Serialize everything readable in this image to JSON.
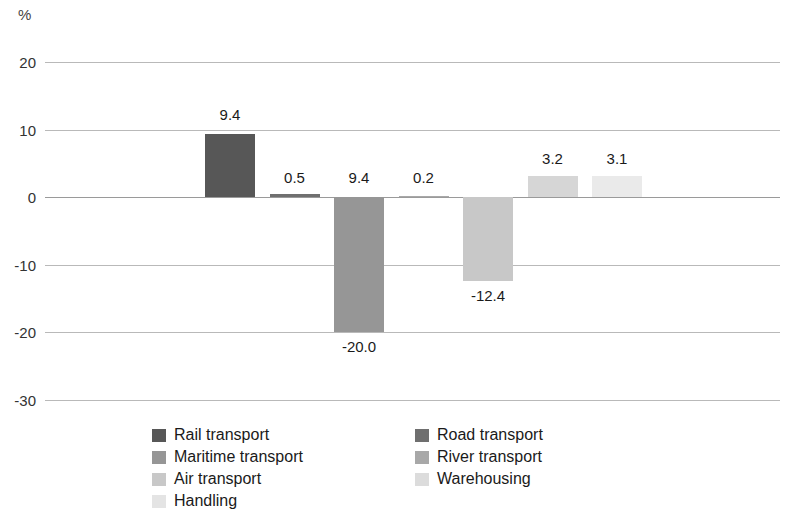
{
  "chart_data": {
    "type": "bar",
    "title": "",
    "subtitle": "",
    "unit_label": "%",
    "xlabel": "",
    "ylabel": "",
    "ylim": [
      -30,
      20
    ],
    "yticks": [
      "20",
      "10",
      "0",
      "-10",
      "-20",
      "-30"
    ],
    "ytick_values": [
      20,
      10,
      0,
      -10,
      -20,
      -30
    ],
    "grid": true,
    "legend_position": "bottom",
    "categories": [
      "Rail transport",
      "Road transport",
      "Maritime transport",
      "River transport",
      "Air transport",
      "Handling",
      "Warehousing"
    ],
    "values": [
      9.4,
      0.5,
      -20.0,
      0.2,
      -12.4,
      3.2,
      3.1
    ],
    "data_labels": [
      "9.4",
      "0.5",
      "9.4",
      "0.2",
      "-12.4",
      "3.2",
      "3.1"
    ],
    "bars": [
      {
        "name": "Rail transport",
        "label": "9.4",
        "value": 9.4,
        "color": "#575757"
      },
      {
        "name": "Road transport",
        "label": "0.5",
        "value": 0.5,
        "color": "#6f6f6f"
      },
      {
        "name": "Maritime transport",
        "label": "9.4",
        "value": -20.0,
        "color": "#969696"
      },
      {
        "name": "River transport",
        "label": "0.2",
        "value": 0.2,
        "color": "#a8a8a8"
      },
      {
        "name": "Air transport",
        "label": "-12.4",
        "value": -12.4,
        "color": "#c8c8c8"
      },
      {
        "name": "Handling",
        "label": "3.2",
        "value": 3.2,
        "color": "#d6d6d6"
      },
      {
        "name": "Warehousing",
        "label": "3.1",
        "value": 3.1,
        "color": "#eaeaea"
      }
    ],
    "below_axis_labels": [
      {
        "name": "Maritime transport",
        "label": "-20.0"
      },
      {
        "name": "Air transport",
        "label": "-12.4"
      }
    ]
  },
  "legend": {
    "left_column": [
      {
        "label": "Rail transport",
        "color": "#575757"
      },
      {
        "label": "Maritime transport",
        "color": "#969696"
      },
      {
        "label": "Air transport",
        "color": "#c8c8c8"
      },
      {
        "label": "Handling",
        "color": "#e4e4e4"
      }
    ],
    "right_column": [
      {
        "label": "Road transport",
        "color": "#6f6f6f"
      },
      {
        "label": "River transport",
        "color": "#a8a8a8"
      },
      {
        "label": "Warehousing",
        "color": "#dcdcdc"
      }
    ]
  }
}
